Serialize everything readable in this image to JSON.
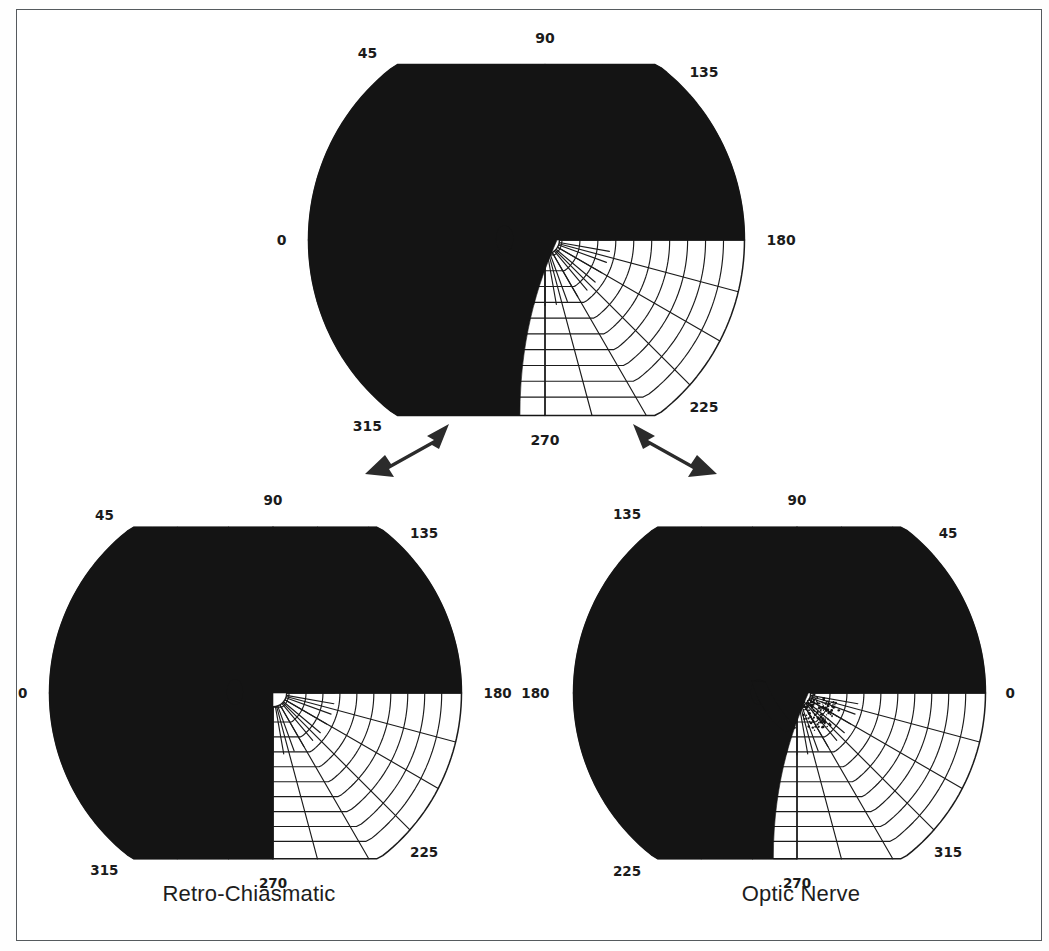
{
  "figure": {
    "kind": "visual-field-perimetry-diagram",
    "background_color": "#ffffff",
    "frame_color": "#555a5e",
    "ink_color": "#1b1b1b",
    "defect_fill": "#141414"
  },
  "charts": [
    {
      "id": "top",
      "name": "binocular-field-chart",
      "caption": "",
      "orientation": "right-eye",
      "meridian_labels": [
        "0",
        "45",
        "90",
        "135",
        "180",
        "225",
        "270",
        "315"
      ],
      "meridian_label_angles_deg": [
        0,
        45,
        90,
        135,
        180,
        225,
        270,
        315
      ],
      "blind_spot": {
        "present": true,
        "side": "left",
        "shape": "ellipse"
      },
      "defect": {
        "present": true,
        "label": "inferior-temporal-quadrantanopia",
        "from_deg": 180,
        "to_deg": 270,
        "sloped_edge": true
      }
    },
    {
      "id": "left",
      "name": "retro-chiasmatic-chart",
      "caption": "Retro-Chiasmatic",
      "orientation": "right-eye",
      "meridian_labels": [
        "0",
        "45",
        "90",
        "135",
        "180",
        "225",
        "270",
        "315"
      ],
      "meridian_label_angles_deg": [
        0,
        45,
        90,
        135,
        180,
        225,
        270,
        315
      ],
      "blind_spot": {
        "present": true,
        "side": "left",
        "shape": "ellipse"
      },
      "defect": {
        "present": true,
        "label": "inferior-homonymous-quadrantanopia",
        "from_deg": 180,
        "to_deg": 270,
        "sloped_edge": false
      }
    },
    {
      "id": "right",
      "name": "optic-nerve-chart",
      "caption": "Optic Nerve",
      "orientation": "left-eye-mirrored",
      "meridian_labels": [
        "180",
        "135",
        "90",
        "45",
        "0",
        "315",
        "270",
        "225"
      ],
      "meridian_label_angles_deg": [
        180,
        135,
        90,
        45,
        0,
        315,
        270,
        225
      ],
      "blind_spot": {
        "present": true,
        "side": "left",
        "shape": "ellipse",
        "connected_to_defect": true,
        "stippled_bridge": true
      },
      "defect": {
        "present": true,
        "label": "inferior-altitudinal-defect",
        "from_deg": 270,
        "to_deg": 360,
        "sloped_edge": true
      }
    }
  ],
  "captions": {
    "left": "Retro-Chiasmatic",
    "right": "Optic Nerve"
  },
  "arrows": [
    {
      "name": "arrow-to-retro-chiasmatic",
      "direction": "down-left"
    },
    {
      "name": "arrow-to-optic-nerve",
      "direction": "down-right"
    }
  ],
  "chart_data": {
    "type": "polar",
    "title": "",
    "subtitle": "",
    "xlabel": "",
    "ylabel": "",
    "grid": true,
    "legend_position": "none",
    "angular_ticks": [
      0,
      45,
      90,
      135,
      180,
      225,
      270,
      315
    ],
    "radial_rings": [
      10,
      20,
      30,
      40,
      50,
      60,
      70,
      80,
      90
    ],
    "series": [
      {
        "name": "Binocular field with inferior-temporal defect",
        "chart": "top",
        "shaded_sector_deg": [
          180,
          270
        ],
        "shaded_fraction": 0.25
      },
      {
        "name": "Retro-Chiasmatic inferior quadrantanopia",
        "chart": "left",
        "shaded_sector_deg": [
          180,
          270
        ],
        "shaded_fraction": 0.25
      },
      {
        "name": "Optic Nerve inferior altitudinal defect",
        "chart": "right",
        "shaded_sector_deg": [
          270,
          360
        ],
        "shaded_fraction": 0.25
      }
    ]
  }
}
